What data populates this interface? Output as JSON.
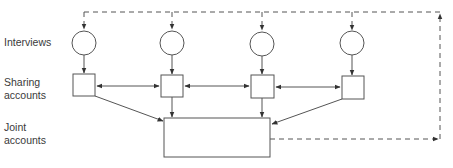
{
  "diagram": {
    "row_labels": {
      "interviews": "Interviews",
      "sharing": "Sharing\naccounts",
      "joint": "Joint\naccounts"
    },
    "nodes": {
      "interviews": [
        {
          "id": "interview-1",
          "shape": "circle"
        },
        {
          "id": "interview-2",
          "shape": "circle"
        },
        {
          "id": "interview-3",
          "shape": "circle"
        },
        {
          "id": "interview-4",
          "shape": "circle"
        }
      ],
      "sharing_accounts": [
        {
          "id": "sharing-1",
          "shape": "square"
        },
        {
          "id": "sharing-2",
          "shape": "square"
        },
        {
          "id": "sharing-3",
          "shape": "square"
        },
        {
          "id": "sharing-4",
          "shape": "square"
        }
      ],
      "joint_account": {
        "id": "joint",
        "shape": "rectangle"
      }
    },
    "edges": [
      {
        "from": "interview-1",
        "to": "sharing-1",
        "style": "solid"
      },
      {
        "from": "interview-2",
        "to": "sharing-2",
        "style": "solid"
      },
      {
        "from": "interview-3",
        "to": "sharing-3",
        "style": "solid"
      },
      {
        "from": "interview-4",
        "to": "sharing-4",
        "style": "solid"
      },
      {
        "from": "sharing-1",
        "to": "sharing-2",
        "style": "solid",
        "bidirectional": true
      },
      {
        "from": "sharing-2",
        "to": "sharing-3",
        "style": "solid",
        "bidirectional": true
      },
      {
        "from": "sharing-3",
        "to": "sharing-4",
        "style": "solid",
        "bidirectional": true
      },
      {
        "from": "sharing-1",
        "to": "joint",
        "style": "solid"
      },
      {
        "from": "sharing-2",
        "to": "joint",
        "style": "solid"
      },
      {
        "from": "sharing-3",
        "to": "joint",
        "style": "solid"
      },
      {
        "from": "sharing-4",
        "to": "joint",
        "style": "solid"
      },
      {
        "from": "joint",
        "to": "interview-1..4",
        "style": "dashed",
        "note": "feedback loop"
      }
    ],
    "colors": {
      "stroke": "#555555",
      "text": "#3a3a3a"
    }
  }
}
